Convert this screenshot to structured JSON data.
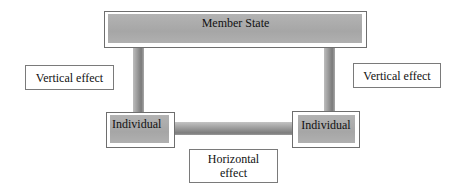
{
  "diagram": {
    "top_node": {
      "label": "Member State"
    },
    "left_node": {
      "label": "Individual"
    },
    "right_node": {
      "label": "Individual"
    },
    "left_annotation": {
      "label": "Vertical effect"
    },
    "right_annotation": {
      "label": "Vertical effect"
    },
    "bottom_annotation": {
      "line1": "Horizontal",
      "line2": "effect"
    },
    "edges": [
      {
        "from": "Member State",
        "to": "Individual (left)",
        "type": "vertical"
      },
      {
        "from": "Member State",
        "to": "Individual (right)",
        "type": "vertical"
      },
      {
        "from": "Individual (left)",
        "to": "Individual (right)",
        "type": "horizontal"
      }
    ],
    "colors": {
      "node_fill": "#a9a9a9",
      "connector": "#8a8a8a",
      "border": "#6e6e6e"
    }
  }
}
